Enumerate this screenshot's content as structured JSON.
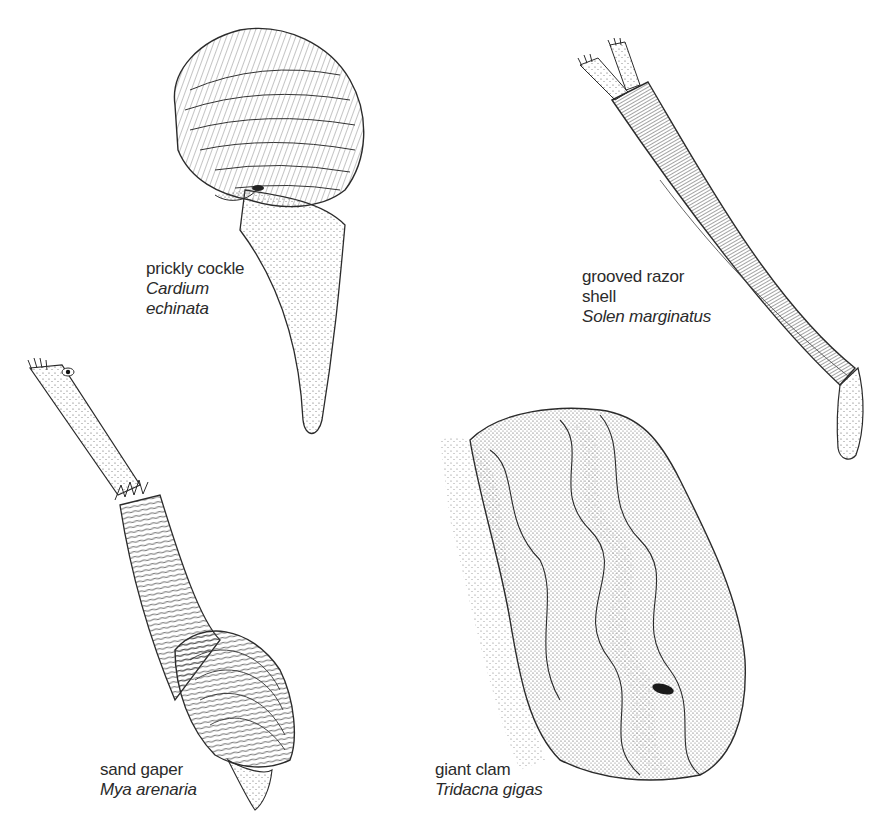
{
  "plate": {
    "background": "#ffffff",
    "ink_color": "#2b2b2b"
  },
  "specimens": [
    {
      "id": "prickly-cockle",
      "common_name": "prickly cockle",
      "latin_lines": [
        "Cardium",
        "echinata"
      ]
    },
    {
      "id": "grooved-razor-shell",
      "common_name_lines": [
        "grooved razor",
        "shell"
      ],
      "latin_name": "Solen marginatus"
    },
    {
      "id": "sand-gaper",
      "common_name": "sand gaper",
      "latin_name": "Mya arenaria"
    },
    {
      "id": "giant-clam",
      "common_name": "giant clam",
      "latin_name": "Tridacna gigas"
    }
  ]
}
